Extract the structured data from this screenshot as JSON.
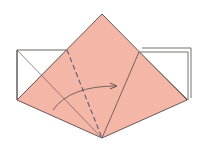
{
  "diagram": {
    "type": "origami-fold-step",
    "colors": {
      "paper_front": "#f4b6a6",
      "paper_back": "#ffffff",
      "line": "#5a4a4a",
      "valley_fold": "#5a5a7a",
      "arrow": "#5a4a4a"
    },
    "elements": [
      {
        "name": "kite-flap",
        "description": "pink diamond-shaped flap"
      },
      {
        "name": "left-white-square",
        "description": "white back side at left"
      },
      {
        "name": "right-white-square",
        "description": "white back side at right, layered"
      },
      {
        "name": "valley-fold-line",
        "description": "dashed fold line"
      },
      {
        "name": "fold-arrow",
        "description": "curved arrow pointing right"
      }
    ]
  }
}
